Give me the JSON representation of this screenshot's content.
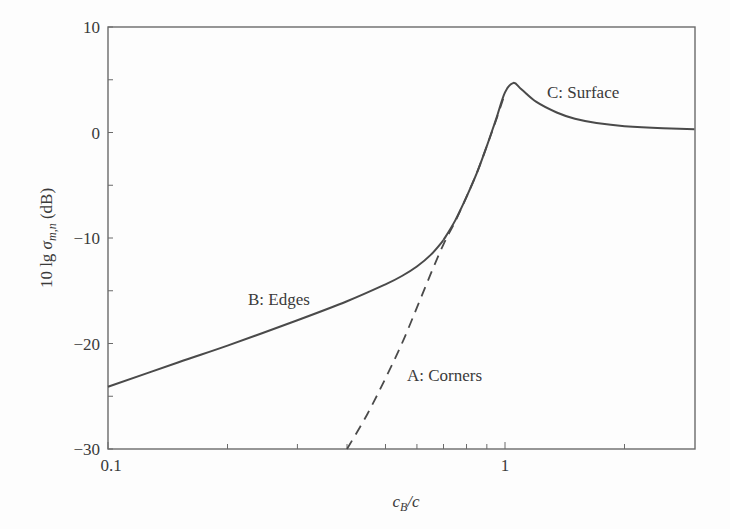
{
  "chart_data": {
    "type": "line",
    "title": "",
    "xlabel": "c_B/c",
    "ylabel": "10 lg σ_m,n (dB)",
    "xscale": "log",
    "xlim": [
      0.1,
      3
    ],
    "ylim": [
      -30,
      10
    ],
    "x_ticks": [
      0.1,
      1
    ],
    "x_minor_ticks": [
      0.2,
      0.3,
      0.4,
      0.5,
      0.6,
      0.7,
      0.8,
      0.9,
      2
    ],
    "y_ticks": [
      10,
      0,
      -10,
      -20,
      -30
    ],
    "y_minor_ticks": [
      5,
      -5,
      -15,
      -25
    ],
    "grid": false,
    "legend": "none",
    "series": [
      {
        "name": "B: Edges",
        "style": "solid",
        "x": [
          0.1,
          0.15,
          0.2,
          0.3,
          0.4,
          0.5,
          0.55,
          0.6,
          0.65,
          0.7
        ],
        "y": [
          -24.1,
          -21.8,
          -20.2,
          -17.8,
          -16.0,
          -14.4,
          -13.6,
          -12.7,
          -11.6,
          -10.2
        ]
      },
      {
        "name": "C: Surface",
        "style": "solid",
        "x": [
          0.7,
          0.75,
          0.8,
          0.85,
          0.9,
          0.95,
          1.0,
          1.05,
          1.1,
          1.2,
          1.35,
          1.5,
          1.7,
          2.0,
          2.5,
          3.0
        ],
        "y": [
          -10.2,
          -8.3,
          -6.1,
          -3.8,
          -1.3,
          1.3,
          3.8,
          4.7,
          4.1,
          2.9,
          1.9,
          1.3,
          0.9,
          0.6,
          0.4,
          0.3
        ]
      },
      {
        "name": "A: Corners",
        "style": "dashed",
        "x": [
          0.4,
          0.45,
          0.5,
          0.55,
          0.6,
          0.65,
          0.7,
          0.75,
          0.8,
          0.85,
          0.9,
          0.95,
          1.0
        ],
        "y": [
          -30.0,
          -26.7,
          -23.3,
          -20.0,
          -16.6,
          -13.4,
          -10.6,
          -8.4,
          -6.1,
          -3.8,
          -1.3,
          1.2,
          3.7
        ]
      }
    ],
    "annotations": [
      {
        "text": "A: Corners",
        "x": 0.6,
        "y": -24
      },
      {
        "text": "B: Edges",
        "x": 0.22,
        "y": -16
      },
      {
        "text": "C: Surface",
        "x": 1.35,
        "y": 3
      }
    ]
  },
  "labels": {
    "y_ticks": [
      "10",
      "0",
      "−10",
      "−20",
      "−30"
    ],
    "x_ticks": [
      "0.1",
      "1"
    ],
    "annot_a": "A: Corners",
    "annot_b": "B: Edges",
    "annot_c": "C: Surface",
    "ylabel_prefix": "10 lg ",
    "ylabel_sym": "σ",
    "ylabel_sub": "m,n",
    "ylabel_suffix": " (dB)",
    "xlabel_c": "c",
    "xlabel_sub": "B",
    "xlabel_rest": "/c"
  },
  "colors": {
    "line": "#4a4a4a",
    "axis": "#6a6a6a",
    "background": "#fdfdfd"
  }
}
